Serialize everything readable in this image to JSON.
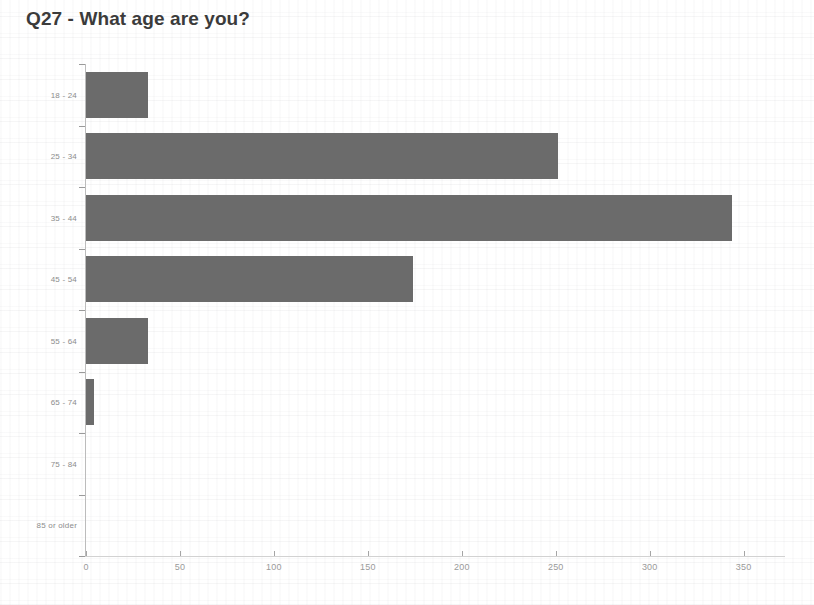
{
  "chart_data": {
    "type": "bar",
    "orientation": "horizontal",
    "title": "Q27 - What age are you?",
    "xlabel": "",
    "ylabel": "",
    "categories": [
      "18 - 24",
      "25 - 34",
      "35 - 44",
      "45 - 54",
      "55 - 64",
      "65 - 74",
      "75 - 84",
      "85 or older"
    ],
    "values": [
      33,
      251,
      344,
      174,
      33,
      4,
      0,
      0
    ],
    "xlim": [
      0,
      372
    ],
    "xticks": [
      0,
      50,
      100,
      150,
      200,
      250,
      300,
      350
    ],
    "xticklabels": [
      "0",
      "50",
      "100",
      "150",
      "200",
      "250",
      "300",
      "350"
    ],
    "grid": false,
    "legend": false,
    "bar_color": "#6b6b6b",
    "axis_color": "#bcbcbc",
    "tick_label_color": "#9a9a9a",
    "title_color": "#3b3b3b"
  }
}
